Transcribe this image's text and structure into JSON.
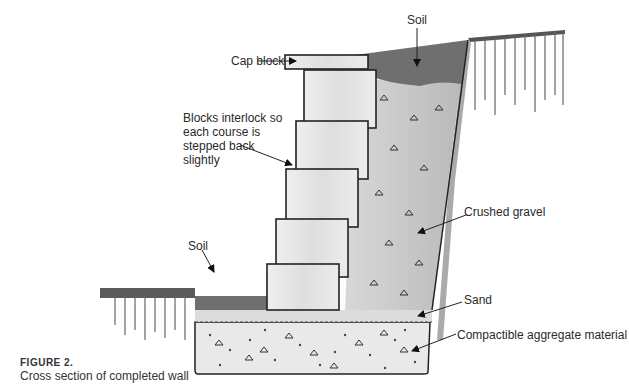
{
  "figure": {
    "number": "FIGURE 2.",
    "caption": "Cross section of completed wall"
  },
  "labels": {
    "soil_top": "Soil",
    "cap_block": "Cap block",
    "blocks_interlock": "Blocks interlock so each course is stepped back slightly",
    "soil_left": "Soil",
    "crushed_gravel": "Crushed gravel",
    "sand": "Sand",
    "compactible_aggregate": "Compactible aggregate material"
  },
  "colors": {
    "outline": "#222222",
    "block_fill": "#e6e6e6",
    "gravel_fill": "#c9c9c9",
    "soil_fill": "#6f6f6f",
    "sand_fill": "#dcdcdc",
    "aggregate_fill": "#e9e9e9"
  }
}
